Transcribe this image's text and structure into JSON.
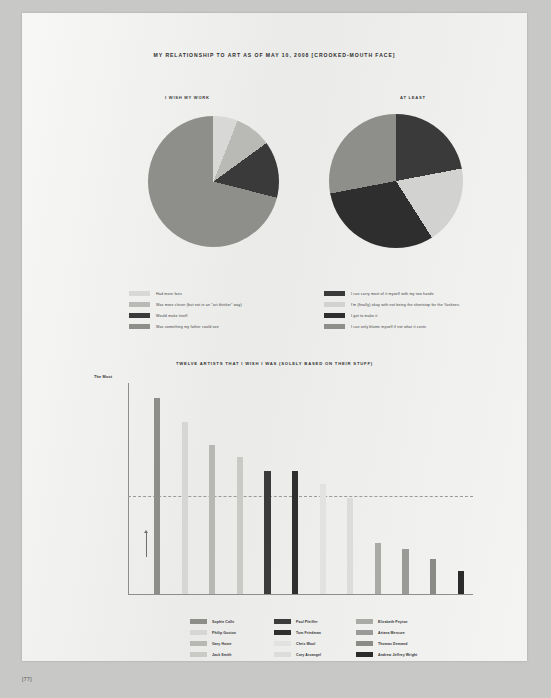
{
  "page": {
    "folio": "[77]",
    "background_color": "#c8c8c6",
    "sheet_color": "#eeeeec"
  },
  "header": {
    "title": "MY RELATIONSHIP TO ART AS OF MAY 10, 2008 [CROOKED-MOUTH FACE]"
  },
  "pies": {
    "left": {
      "label": "I WISH MY WORK",
      "legend": [
        {
          "text": "Had more fans",
          "color": "#d8d8d6"
        },
        {
          "text": "Was more clever (but not in an \"art-thinker\" way)",
          "color": "#b9b9b6"
        },
        {
          "text": "Would make itself",
          "color": "#3a3a3a"
        },
        {
          "text": "Was something my father could see",
          "color": "#8e8e8b"
        }
      ]
    },
    "right": {
      "label": "AT LEAST",
      "legend": [
        {
          "text": "I can carry most of it myself with my two hands",
          "color": "#3a3a3a"
        },
        {
          "text": "I'm (finally) okay with not being the shortstop for the Yankees.",
          "color": "#d2d2d0"
        },
        {
          "text": "I got to make it",
          "color": "#2e2e2e"
        },
        {
          "text": "I can only blame myself if not what it costs",
          "color": "#8e8e8b"
        }
      ]
    }
  },
  "bar_section": {
    "title": "TWELVE ARTISTS THAT I WISH I WAS (SOLELY BASED ON THEIR STUFF)",
    "axis_top_label": "The Most",
    "legend_columns": [
      [
        {
          "text": "Sophie Calle",
          "color": "#8d8d8a"
        },
        {
          "text": "Philip Guston",
          "color": "#d6d6d4"
        },
        {
          "text": "Gary Hume",
          "color": "#b7b7b4"
        },
        {
          "text": "Jack Smith",
          "color": "#c9c9c6"
        }
      ],
      [
        {
          "text": "Paul Pfeiffer",
          "color": "#3b3b3b"
        },
        {
          "text": "Tom Friedman",
          "color": "#2f2f2f"
        },
        {
          "text": "Chris Wool",
          "color": "#e2e2e0"
        },
        {
          "text": "Cory Arcangel",
          "color": "#dcdcda"
        }
      ],
      [
        {
          "text": "Elizabeth Peyton",
          "color": "#a9a9a6"
        },
        {
          "text": "Ariana Mercure",
          "color": "#9a9a97"
        },
        {
          "text": "Thomas Demand",
          "color": "#8a8a87"
        },
        {
          "text": "Andrew Jeffrey Wright",
          "color": "#2b2b2b"
        }
      ]
    ]
  },
  "chart_data": [
    {
      "type": "pie",
      "title": "I WISH MY WORK",
      "labels": [
        "Had more fans",
        "Was more clever (but not in an \"art-thinker\" way)",
        "Would make itself",
        "Was something my father could see"
      ],
      "values": [
        6,
        9,
        14,
        71
      ],
      "colors": [
        "#d8d8d6",
        "#b9b9b6",
        "#3a3a3a",
        "#8e8e8b"
      ],
      "legend_position": "below"
    },
    {
      "type": "pie",
      "title": "AT LEAST",
      "labels": [
        "I can carry most of it myself with my two hands",
        "I'm (finally) okay with not being the shortstop for the Yankees.",
        "I got to make it",
        "I can only blame myself if not what it costs"
      ],
      "values": [
        22,
        19,
        31,
        28
      ],
      "colors": [
        "#3a3a3a",
        "#d2d2d0",
        "#2e2e2e",
        "#8e8e8b"
      ],
      "legend_position": "below"
    },
    {
      "type": "bar",
      "title": "TWELVE ARTISTS THAT I WISH I WAS (SOLELY BASED ON THEIR STUFF)",
      "categories": [
        "Sophie Calle",
        "Philip Guston",
        "Gary Hume",
        "Jack Smith",
        "Paul Pfeiffer",
        "Tom Friedman",
        "Chris Wool",
        "Cory Arcangel",
        "Elizabeth Peyton",
        "Ariana Mercure",
        "Thomas Demand",
        "Andrew Jeffrey Wright"
      ],
      "values": [
        100,
        88,
        76,
        70,
        63,
        63,
        56,
        49,
        26,
        23,
        18,
        12
      ],
      "colors": [
        "#8d8d8a",
        "#d6d6d4",
        "#b7b7b4",
        "#c9c9c6",
        "#3b3b3b",
        "#2f2f2f",
        "#e2e2e0",
        "#dcdcda",
        "#a9a9a6",
        "#9a9a97",
        "#8a8a87",
        "#2b2b2b"
      ],
      "ylabel": "The Most",
      "xlabel": "",
      "ylim": [
        0,
        105
      ],
      "grid": false,
      "reference_line": 50,
      "annotations": [
        "The Most"
      ]
    }
  ]
}
